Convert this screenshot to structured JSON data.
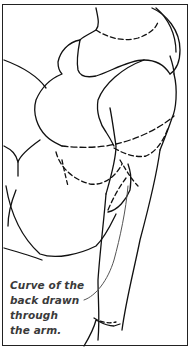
{
  "figure": {
    "caption_lines": [
      "Curve of the",
      "back drawn",
      "through",
      "the arm."
    ],
    "colors": {
      "line": "#111111",
      "caption": "#3a3a3a",
      "border": "#222222"
    }
  }
}
